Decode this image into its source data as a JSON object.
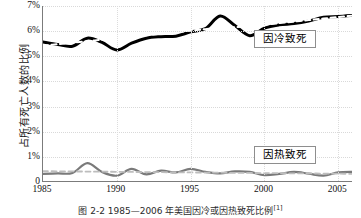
{
  "axes": {
    "ylabel": "占所有死亡人数的比例",
    "yticks": [
      "7%",
      "6%",
      "5%",
      "4%",
      "3%",
      "2%",
      "1%",
      "0"
    ],
    "ytick_values": [
      7,
      6,
      5,
      4,
      3,
      2,
      1,
      0
    ],
    "xticks": [
      "1985",
      "1990",
      "1995",
      "2000",
      "2005"
    ],
    "xtick_values": [
      1985,
      1990,
      1995,
      2000,
      2005
    ]
  },
  "legend": {
    "cold": "因冷致死",
    "heat": "因热致死"
  },
  "caption": {
    "text": "图 2-2  1985—2006 年美国因冷或因热致死比例",
    "ref": "[1]"
  },
  "colors": {
    "cold_line": "#000000",
    "cold_trend": "#ffffff",
    "heat_line": "#7a7a7a",
    "heat_trend": "#bdbdbd",
    "axis": "#7b7b7b",
    "grid": "#d9d9d9",
    "background": "#ffffff"
  },
  "chart_data": {
    "type": "line",
    "title": "图 2-2  1985—2006 年美国因冷或因热致死比例",
    "xlabel": "",
    "ylabel": "占所有死亡人数的比例",
    "xlim": [
      1985,
      2006
    ],
    "ylim": [
      0,
      7
    ],
    "grid": true,
    "legend_position": "inside-right",
    "x": [
      1985,
      1986,
      1987,
      1988,
      1989,
      1990,
      1991,
      1992,
      1993,
      1994,
      1995,
      1996,
      1997,
      1998,
      1999,
      2000,
      2001,
      2002,
      2003,
      2004,
      2005,
      2006
    ],
    "series": [
      {
        "name": "因冷致死",
        "style": "solid",
        "color": "#000000",
        "values": [
          5.57,
          5.47,
          5.4,
          5.72,
          5.55,
          5.25,
          5.52,
          5.72,
          5.78,
          5.8,
          5.97,
          6.1,
          6.6,
          6.22,
          5.82,
          6.12,
          6.25,
          6.3,
          6.4,
          6.55,
          6.58,
          6.63
        ]
      },
      {
        "name": "因冷致死趋势线",
        "style": "dashed",
        "color": "#ffffff",
        "values": [
          5.42,
          5.48,
          5.54,
          5.6,
          5.66,
          5.72,
          5.78,
          5.84,
          5.9,
          5.96,
          6.02,
          6.08,
          6.13,
          6.16,
          6.2,
          6.26,
          6.32,
          6.38,
          6.44,
          6.5,
          6.56,
          6.62
        ]
      },
      {
        "name": "因热致死",
        "style": "solid",
        "color": "#7a7a7a",
        "values": [
          0.32,
          0.34,
          0.36,
          0.75,
          0.4,
          0.25,
          0.52,
          0.3,
          0.45,
          0.38,
          0.52,
          0.4,
          0.34,
          0.42,
          0.4,
          0.27,
          0.32,
          0.4,
          0.33,
          0.25,
          0.38,
          0.4
        ]
      },
      {
        "name": "因热致死趋势线",
        "style": "dashed",
        "color": "#bdbdbd",
        "values": [
          0.43,
          0.425,
          0.42,
          0.415,
          0.41,
          0.405,
          0.4,
          0.395,
          0.39,
          0.385,
          0.38,
          0.375,
          0.37,
          0.365,
          0.36,
          0.355,
          0.35,
          0.345,
          0.34,
          0.335,
          0.33,
          0.325
        ]
      }
    ]
  }
}
